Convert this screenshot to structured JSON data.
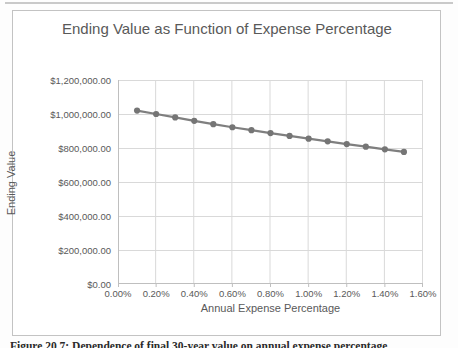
{
  "page": {
    "caption": "Figure 20.7: Dependence of final 30-year value on annual expense percentage"
  },
  "chart": {
    "title": "Ending Value as Function of Expense Percentage",
    "x_axis_title": "Annual Expense Percentage",
    "y_axis_title": "Ending Value"
  },
  "colors": {
    "series": "#7f7f7f",
    "marker": "#757575",
    "gridline": "#d9d9d9",
    "axis_line": "#bfbfbf",
    "title_text": "#595959",
    "tick_text": "#595959",
    "chart_border": "#c3c3c3"
  },
  "chart_data": {
    "type": "line",
    "title": "Ending Value as Function of Expense Percentage",
    "xlabel": "Annual Expense Percentage",
    "ylabel": "Ending Value",
    "legend": "none",
    "grid": true,
    "marker": "circle",
    "xlim": [
      0,
      1.6
    ],
    "ylim": [
      0,
      1200000
    ],
    "x_tick_labels": [
      "0.00%",
      "0.20%",
      "0.40%",
      "0.60%",
      "0.80%",
      "1.00%",
      "1.20%",
      "1.40%",
      "1.60%"
    ],
    "y_tick_labels": [
      "$0.00",
      "$200,000.00",
      "$400,000.00",
      "$600,000.00",
      "$800,000.00",
      "$1,000,000.00",
      "$1,200,000.00"
    ],
    "x_percent": [
      0.1,
      0.2,
      0.3,
      0.4,
      0.5,
      0.6,
      0.7,
      0.8,
      0.9,
      1.0,
      1.1,
      1.2,
      1.3,
      1.4,
      1.5
    ],
    "values": [
      1020000,
      1000000,
      980000,
      960000,
      940000,
      922000,
      905000,
      888000,
      871000,
      855000,
      839000,
      823000,
      808000,
      792000,
      777000
    ]
  }
}
